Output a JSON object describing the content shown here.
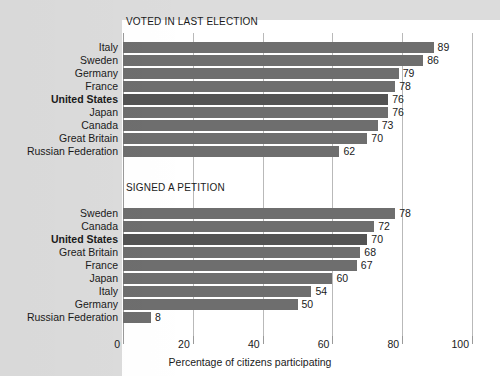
{
  "chart_data": {
    "type": "bar",
    "orientation": "horizontal",
    "title": "",
    "xlabel": "Percentage of citizens participating",
    "ylabel": "",
    "xlim": [
      0,
      100
    ],
    "xticks": [
      0,
      20,
      40,
      60,
      80,
      100
    ],
    "xtick_labels": [
      "0",
      "20",
      "40",
      "60",
      "80",
      "100"
    ],
    "grid": true,
    "legend": "none",
    "highlight_category": "United States",
    "panels": [
      {
        "title": "VOTED IN LAST ELECTION",
        "categories": [
          "Italy",
          "Sweden",
          "Germany",
          "France",
          "United States",
          "Japan",
          "Canada",
          "Great Britain",
          "Russian Federation"
        ],
        "values": [
          89,
          86,
          79,
          78,
          76,
          76,
          73,
          70,
          62
        ],
        "value_labels": [
          "89",
          "86",
          "79",
          "78",
          "76",
          "76",
          "73",
          "70",
          "62"
        ],
        "highlighted": [
          false,
          false,
          false,
          false,
          true,
          false,
          false,
          false,
          false
        ]
      },
      {
        "title": "SIGNED A PETITION",
        "categories": [
          "Sweden",
          "Canada",
          "United States",
          "Great Britain",
          "France",
          "Japan",
          "Italy",
          "Germany",
          "Russian Federation"
        ],
        "values": [
          78,
          72,
          70,
          68,
          67,
          60,
          54,
          50,
          8
        ],
        "value_labels": [
          "78",
          "72",
          "70",
          "68",
          "67",
          "60",
          "54",
          "50",
          "8"
        ],
        "highlighted": [
          false,
          false,
          true,
          false,
          false,
          false,
          false,
          false,
          false
        ]
      }
    ]
  },
  "colors": {
    "background": "#ffffff",
    "plate": "#dcdcdc",
    "bar": "#6e6e6e",
    "bar_highlight": "#535353",
    "gridline": "#b9b9b9",
    "text": "#1a1a1a"
  }
}
